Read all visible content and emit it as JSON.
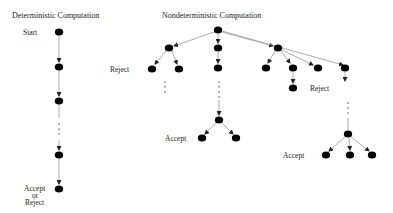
{
  "deterministic": {
    "title": "Deterministic Computation",
    "start_label": "Start",
    "end_label_1": "Accept",
    "end_label_2": "or",
    "end_label_3": "Reject"
  },
  "nondeterministic": {
    "title": "Nondeterministic Computation",
    "reject_label_left": "Reject",
    "reject_label_right": "Reject",
    "accept_label_middle": "Accept",
    "accept_label_right": "Accept"
  },
  "colors": {
    "node": "#000000",
    "edge": "#888888",
    "text": "#222222"
  }
}
